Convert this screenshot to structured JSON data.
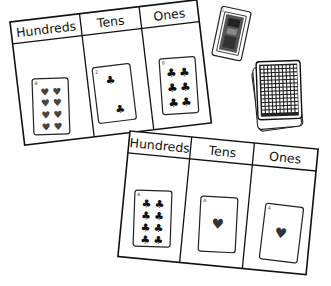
{
  "scene": {
    "description": "Place value mats with playing cards",
    "colors": {
      "ink": "#111111",
      "paper": "#ffffff",
      "heart_pip": "#333333",
      "club_pip": "#111111"
    }
  },
  "mats": [
    {
      "id": "top-mat",
      "headers": [
        "Hundreds",
        "Tens",
        "Ones"
      ],
      "cards": [
        {
          "column": "Hundreds",
          "rank": "8",
          "suit": "hearts",
          "suit_icon": "heart-icon",
          "glyph": "♥"
        },
        {
          "column": "Tens",
          "rank": "2",
          "suit": "clubs",
          "suit_icon": "club-icon",
          "glyph": "♣"
        },
        {
          "column": "Ones",
          "rank": "6",
          "suit": "clubs",
          "suit_icon": "club-icon",
          "glyph": "♣"
        }
      ],
      "number_shown": "826"
    },
    {
      "id": "bottom-mat",
      "headers": [
        "Hundreds",
        "Tens",
        "Ones"
      ],
      "cards": [
        {
          "column": "Hundreds",
          "rank": "8",
          "suit": "clubs",
          "suit_icon": "club-icon",
          "glyph": "♣"
        },
        {
          "column": "Tens",
          "rank": "A",
          "suit": "hearts",
          "suit_icon": "heart-icon",
          "glyph": "♥"
        },
        {
          "column": "Ones",
          "rank": "A",
          "suit": "hearts",
          "suit_icon": "heart-icon",
          "glyph": "♥"
        }
      ],
      "number_shown": "811"
    }
  ],
  "loose_cards": {
    "face_card": {
      "type": "face card (jack)",
      "icon": "face-card-icon"
    },
    "deck": {
      "type": "face-down deck",
      "icon": "card-deck-icon"
    }
  }
}
